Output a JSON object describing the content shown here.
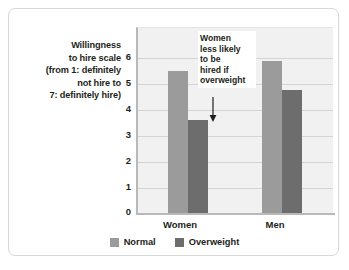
{
  "chart_data": {
    "type": "bar",
    "title": "",
    "subtitle": "",
    "xlabel": "",
    "ylabel": "Willingness to hire scale (from 1: definitely not hire to 7: definitely hire)",
    "ylabel_lines": [
      "Willingness",
      "to hire scale",
      "(from 1: definitely",
      "not hire to",
      "7: definitely hire)"
    ],
    "categories": [
      "Women",
      "Men"
    ],
    "series": [
      {
        "name": "Normal",
        "color": "#9b9b9b",
        "values": [
          5.5,
          5.9
        ]
      },
      {
        "name": "Overweight",
        "color": "#6d6d6d",
        "values": [
          3.6,
          4.75
        ]
      }
    ],
    "ylim": [
      0,
      7.15
    ],
    "yticks": [
      0,
      1,
      2,
      3,
      4,
      5,
      6
    ],
    "ytick_labels": [
      "0",
      "1",
      "2",
      "3",
      "4",
      "5",
      "6"
    ],
    "grid": true,
    "legend_position": "bottom",
    "annotations": [
      {
        "text": "Women less likely to be hired if overweight",
        "lines": [
          "Women",
          "less likely",
          "to be",
          "hired if",
          "overweight"
        ],
        "points_to": "Women / Overweight bar",
        "arrow": "down-arrow-icon"
      }
    ]
  },
  "legend": {
    "entries": [
      {
        "label": "Normal",
        "color": "#9b9b9b"
      },
      {
        "label": "Overweight",
        "color": "#6d6d6d"
      }
    ]
  },
  "colors": {
    "card_border": "#d8d8d8",
    "plot_background": "#f1f1f1",
    "axis_line": "#b9b9b9",
    "gridline": "#d4d4d4",
    "text": "#231f20",
    "normal_bar": "#9b9b9b",
    "overweight_bar": "#6d6d6d"
  }
}
